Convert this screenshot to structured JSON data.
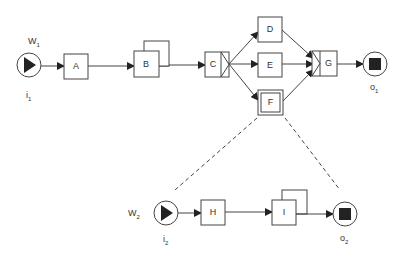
{
  "diagram": {
    "type": "workflow-net",
    "colors": {
      "stroke": "#444444",
      "fill": "#ffffff",
      "marker": "#222222"
    },
    "workflows": [
      {
        "name": "W1",
        "name_main": "W",
        "name_sub": "1",
        "input": {
          "label": "i",
          "sub": "1"
        },
        "output": {
          "label": "o",
          "sub": "1"
        },
        "tasks": [
          "A",
          "B",
          "C",
          "D",
          "E",
          "F",
          "G"
        ]
      },
      {
        "name": "W2",
        "name_main": "W",
        "name_sub": "2",
        "input": {
          "label": "i",
          "sub": "2"
        },
        "output": {
          "label": "o",
          "sub": "2"
        },
        "tasks": [
          "H",
          "I"
        ]
      }
    ],
    "tasks": {
      "A": "A",
      "B": "B",
      "C": "C",
      "D": "D",
      "E": "E",
      "F": "F",
      "G": "G",
      "H": "H",
      "I": "I"
    },
    "notes": {
      "B": "multiple instance task",
      "I": "multiple instance task",
      "C": "AND-split",
      "G": "AND-join",
      "F": "composite task decomposed into W2"
    }
  }
}
